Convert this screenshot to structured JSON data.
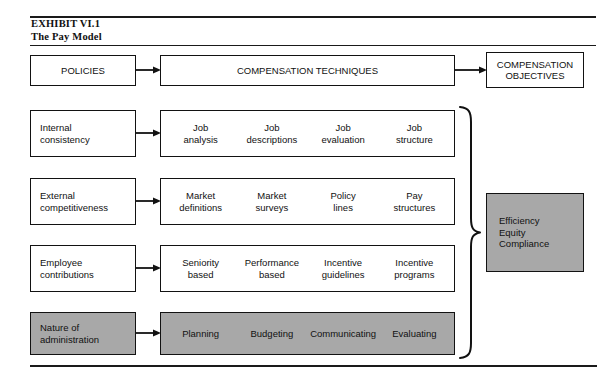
{
  "exhibit": {
    "caption_line1": "EXHIBIT VI.1",
    "caption_line2": "The Pay Model"
  },
  "top_row": {
    "policies_label": "POLICIES",
    "techniques_label": "COMPENSATION TECHNIQUES",
    "objectives_label": "COMPENSATION\nOBJECTIVES"
  },
  "rows": [
    {
      "policy": "Internal\nconsistency",
      "techniques": [
        "Job\nanalysis",
        "Job\ndescriptions",
        "Job\nevaluation",
        "Job\nstructure"
      ],
      "shaded": false
    },
    {
      "policy": "External\ncompetitiveness",
      "techniques": [
        "Market\ndefinitions",
        "Market\nsurveys",
        "Policy\nlines",
        "Pay\nstructures"
      ],
      "shaded": false
    },
    {
      "policy": "Employee\ncontributions",
      "techniques": [
        "Seniority\nbased",
        "Performance\nbased",
        "Incentive\nguidelines",
        "Incentive\nprograms"
      ],
      "shaded": false
    },
    {
      "policy": "Nature of\nadministration",
      "techniques": [
        "Planning",
        "Budgeting",
        "Communicating",
        "Evaluating"
      ],
      "shaded": true
    }
  ],
  "results": {
    "label": "Efficiency\nEquity\nCompliance"
  },
  "colors": {
    "shaded_fill": "#a8a8a8",
    "line": "#121212",
    "text": "#111111",
    "background": "#ffffff"
  },
  "icons": {
    "arrow": "arrow-right-icon",
    "brace": "right-curly-brace-icon"
  }
}
